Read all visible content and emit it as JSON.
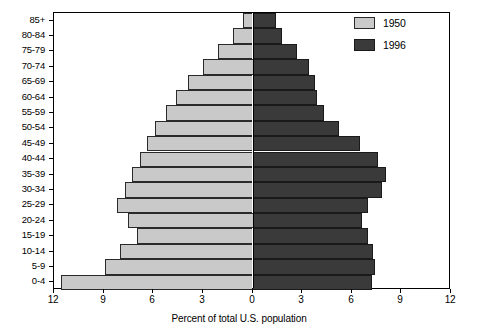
{
  "chart_data": {
    "type": "bar",
    "title": "",
    "subtitle": "",
    "xlabel": "Percent of total U.S. population",
    "ylabel": "",
    "orientation": "horizontal-diverging",
    "layout": "population-pyramid",
    "grid": false,
    "legend_position": "top-right",
    "xlim": [
      -12,
      12
    ],
    "xticks": [
      12,
      9,
      6,
      3,
      0,
      3,
      6,
      9,
      12
    ],
    "xtick_labels": [
      "12",
      "9",
      "6",
      "3",
      "0",
      "3",
      "6",
      "9",
      "12"
    ],
    "categories": [
      "0-4",
      "5-9",
      "10-14",
      "15-19",
      "20-24",
      "25-29",
      "30-34",
      "35-39",
      "40-44",
      "45-49",
      "50-54",
      "55-59",
      "60-64",
      "65-69",
      "70-74",
      "75-79",
      "80-84",
      "85+"
    ],
    "series": [
      {
        "name": "1950",
        "side": "left",
        "color": "#c9c9c9",
        "values": [
          11.6,
          8.9,
          8.0,
          7.0,
          7.5,
          8.2,
          7.7,
          7.3,
          6.8,
          6.4,
          5.9,
          5.2,
          4.6,
          3.9,
          3.0,
          2.1,
          1.2,
          0.6
        ]
      },
      {
        "name": "1996",
        "side": "right",
        "color": "#3a3a3a",
        "values": [
          7.2,
          7.4,
          7.3,
          7.0,
          6.6,
          7.0,
          7.8,
          8.1,
          7.6,
          6.5,
          5.2,
          4.3,
          3.9,
          3.8,
          3.4,
          2.7,
          1.8,
          1.4
        ]
      }
    ],
    "legend": [
      {
        "label": "1950",
        "color": "#c9c9c9"
      },
      {
        "label": "1996",
        "color": "#3a3a3a"
      }
    ]
  },
  "axis": {
    "x_title": "Percent of total U.S. population"
  }
}
